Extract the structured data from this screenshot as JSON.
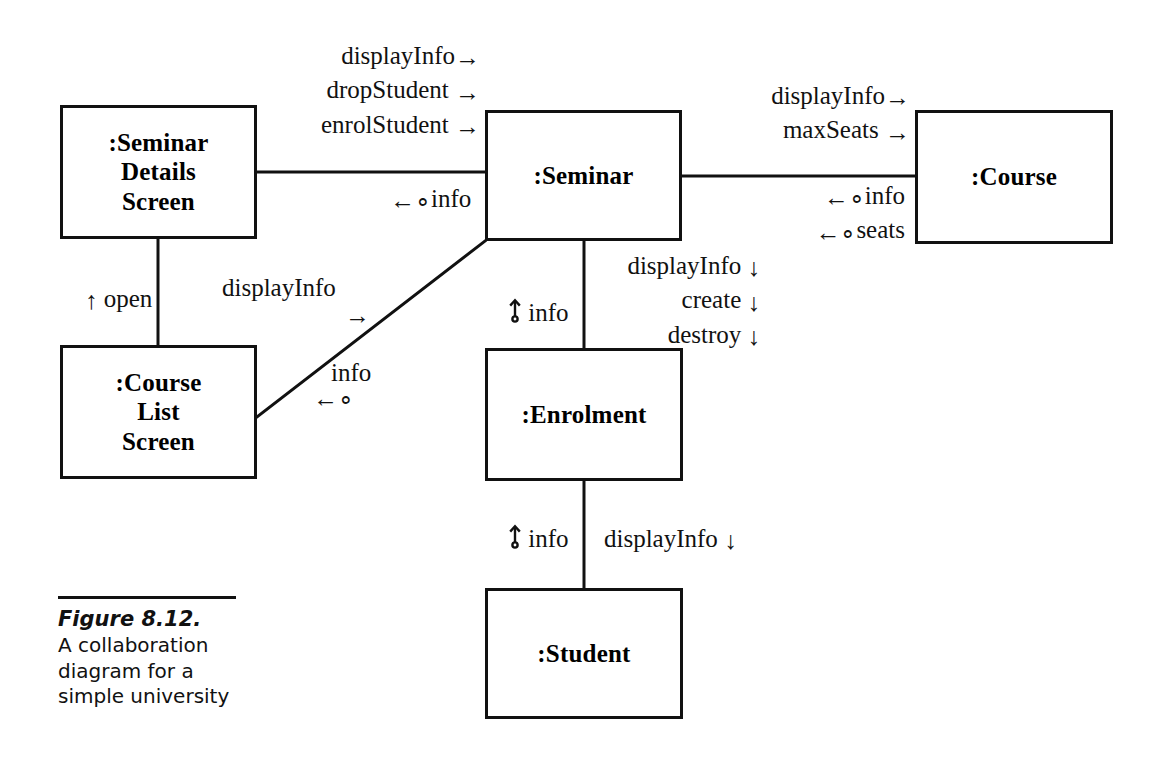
{
  "figure": {
    "number_label": "Figure 8.12.",
    "caption": "A collaboration diagram for a simple university",
    "diagram_type": "UML collaboration diagram"
  },
  "objects": {
    "seminar_details_screen": {
      "label": ":Seminar\nDetails\nScreen"
    },
    "course_list_screen": {
      "label": ":Course\nList\nScreen"
    },
    "seminar": {
      "label": ":Seminar"
    },
    "enrolment": {
      "label": ":Enrolment"
    },
    "student": {
      "label": ":Student"
    },
    "course": {
      "label": ":Course"
    }
  },
  "messages": {
    "screen_to_seminar": [
      {
        "text": "displayInfo",
        "direction": "right"
      },
      {
        "text": "dropStudent",
        "direction": "right"
      },
      {
        "text": "enrolStudent",
        "direction": "right"
      }
    ],
    "seminar_to_screen_return": [
      {
        "text": "info",
        "direction": "left-return"
      }
    ],
    "seminar_to_course": [
      {
        "text": "displayInfo",
        "direction": "right"
      },
      {
        "text": "maxSeats",
        "direction": "right"
      }
    ],
    "course_to_seminar_return": [
      {
        "text": "info",
        "direction": "left-return"
      },
      {
        "text": "seats",
        "direction": "left-return"
      }
    ],
    "seminar_to_enrolment": [
      {
        "text": "displayInfo",
        "direction": "down"
      },
      {
        "text": "create",
        "direction": "down"
      },
      {
        "text": "destroy",
        "direction": "down"
      }
    ],
    "enrolment_to_seminar_return": [
      {
        "text": "info",
        "direction": "up-return"
      }
    ],
    "enrolment_to_student": [
      {
        "text": "displayInfo",
        "direction": "down"
      }
    ],
    "student_to_enrolment_return": [
      {
        "text": "info",
        "direction": "up-return"
      }
    ],
    "course_list_to_details": [
      {
        "text": "open",
        "direction": "up"
      }
    ],
    "course_list_to_seminar": [
      {
        "text": "displayInfo",
        "direction": "right-diagonal"
      }
    ],
    "seminar_to_course_list_return": [
      {
        "text": "info",
        "direction": "left-return"
      }
    ]
  },
  "icons": {
    "arrow_right": "→",
    "arrow_left": "←",
    "arrow_down": "↓",
    "arrow_up": "↑",
    "return_marker": "∘"
  },
  "colors": {
    "stroke": "#111111",
    "background": "#ffffff",
    "text": "#111111"
  }
}
